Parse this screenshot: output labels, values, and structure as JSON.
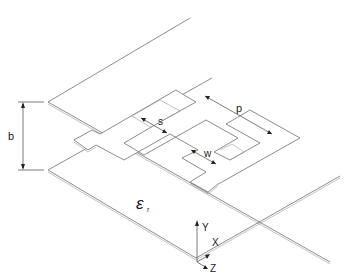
{
  "diagram": {
    "labels": {
      "plate_spacing": "b",
      "period": "p",
      "spacing": "s",
      "width": "w",
      "permittivity_symbol": "ε",
      "permittivity_subscript": "r"
    },
    "axes": {
      "y": "Y",
      "x": "X",
      "z": "Z"
    },
    "colors": {
      "line": "#6e6e6e",
      "text": "#222222",
      "background": "#ffffff"
    }
  }
}
